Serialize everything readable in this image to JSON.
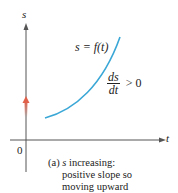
{
  "figure": {
    "axes": {
      "y_label": "s",
      "x_label": "t",
      "origin_label": "0"
    },
    "curve_label": "s = f(t)",
    "derivative": {
      "numerator": "ds",
      "denominator": "dt",
      "relation": "> 0"
    },
    "caption": {
      "line1_prefix": "(a) ",
      "line1_var": "s",
      "line1_rest": " increasing:",
      "line2": "positive slope so",
      "line3": "moving upward"
    },
    "colors": {
      "curve": "#3aa7d6",
      "axis": "#555555",
      "arrow": "#e0604a"
    }
  }
}
